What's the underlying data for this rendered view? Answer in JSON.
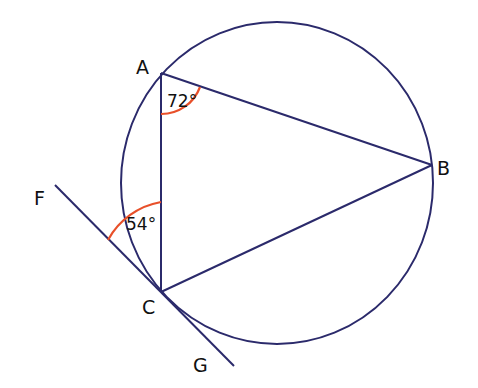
{
  "diagram": {
    "colors": {
      "line": "#2b2a6b",
      "angle_arc": "#e8502a",
      "text": "#111111",
      "background": "#ffffff"
    },
    "points": {
      "A": {
        "label": "A"
      },
      "B": {
        "label": "B"
      },
      "C": {
        "label": "C"
      },
      "F": {
        "label": "F"
      },
      "G": {
        "label": "G"
      }
    },
    "angles": {
      "angle_A": {
        "label": "72°",
        "vertex": "A"
      },
      "angle_FCA": {
        "label": "54°",
        "vertex": "C"
      }
    },
    "elements": [
      "circle",
      "triangle ABC",
      "tangent line FG through C"
    ]
  }
}
